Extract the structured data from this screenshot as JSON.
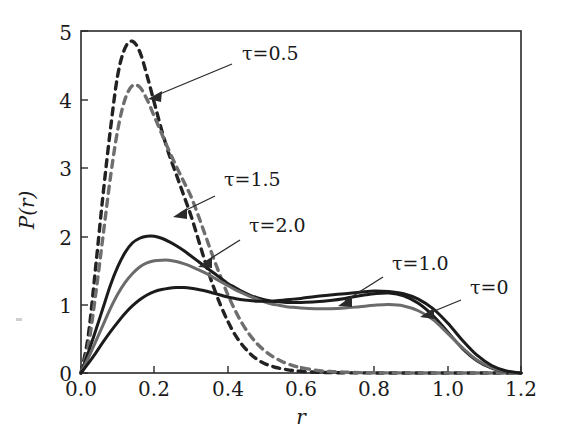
{
  "figure": {
    "background_color": "#ffffff",
    "frame_color": "#2a2a2a"
  },
  "axes": {
    "x_title": "r",
    "y_title": "P(r)",
    "x_ticks": [
      "0.0",
      "0.2",
      "0.4",
      "0.6",
      "0.8",
      "1.0",
      "1.2"
    ],
    "y_ticks": [
      "0",
      "1",
      "2",
      "3",
      "4",
      "5"
    ]
  },
  "annotations": [
    {
      "name": "tau-0.5",
      "text": "τ=0.5"
    },
    {
      "name": "tau-1.5",
      "text": "τ=1.5"
    },
    {
      "name": "tau-2.0",
      "text": "τ=2.0"
    },
    {
      "name": "tau-1.0",
      "text": "τ=1.0"
    },
    {
      "name": "tau-0",
      "text": "τ=0"
    }
  ],
  "chart_data": {
    "type": "line",
    "title": "",
    "xlabel": "r",
    "ylabel": "P(r)",
    "xlim": [
      0.0,
      1.2
    ],
    "ylim": [
      0,
      5
    ],
    "xticks": [
      0.0,
      0.2,
      0.4,
      0.6,
      0.8,
      1.0,
      1.2
    ],
    "yticks": [
      0,
      1,
      2,
      3,
      4,
      5
    ],
    "grid": false,
    "legend": "inline-annotations",
    "x": [
      0.0,
      0.02,
      0.04,
      0.06,
      0.08,
      0.1,
      0.12,
      0.14,
      0.16,
      0.18,
      0.2,
      0.22,
      0.24,
      0.26,
      0.28,
      0.3,
      0.32,
      0.34,
      0.36,
      0.38,
      0.4,
      0.42,
      0.44,
      0.46,
      0.48,
      0.5,
      0.52,
      0.54,
      0.56,
      0.58,
      0.6,
      0.64,
      0.68,
      0.72,
      0.76,
      0.8,
      0.84,
      0.88,
      0.92,
      0.96,
      1.0,
      1.04,
      1.08,
      1.12,
      1.16,
      1.2
    ],
    "series": [
      {
        "name": "τ=0.5",
        "style": "dashed",
        "color": "#222222",
        "peak_x": 0.13,
        "peak_y": 4.85,
        "values": [
          0.0,
          0.55,
          1.55,
          2.6,
          3.55,
          4.35,
          4.75,
          4.85,
          4.7,
          4.35,
          3.95,
          3.55,
          3.2,
          2.9,
          2.6,
          2.3,
          1.95,
          1.6,
          1.28,
          1.0,
          0.76,
          0.56,
          0.41,
          0.29,
          0.2,
          0.14,
          0.1,
          0.07,
          0.05,
          0.035,
          0.025,
          0.012,
          0.006,
          0.003,
          0.002,
          0.001,
          0.0,
          0.0,
          0.0,
          0.0,
          0.0,
          0.0,
          0.0,
          0.0,
          0.0,
          0.0
        ]
      },
      {
        "name": "τ=1.5",
        "style": "dashed",
        "color": "#6e6e6e",
        "peak_x": 0.145,
        "peak_y": 4.2,
        "values": [
          0.0,
          0.4,
          1.15,
          2.0,
          2.85,
          3.55,
          4.0,
          4.2,
          4.18,
          4.0,
          3.75,
          3.5,
          3.25,
          3.02,
          2.8,
          2.58,
          2.3,
          2.0,
          1.7,
          1.42,
          1.15,
          0.92,
          0.72,
          0.56,
          0.43,
          0.33,
          0.25,
          0.19,
          0.14,
          0.105,
          0.078,
          0.042,
          0.022,
          0.012,
          0.006,
          0.003,
          0.002,
          0.001,
          0.0,
          0.0,
          0.0,
          0.0,
          0.0,
          0.0,
          0.0,
          0.0
        ]
      },
      {
        "name": "τ=2.0",
        "style": "solid",
        "color": "#1b1b1b",
        "peak_x": 0.2,
        "peak_y": 2.0,
        "values": [
          0.0,
          0.3,
          0.62,
          0.95,
          1.28,
          1.55,
          1.76,
          1.9,
          1.97,
          2.0,
          2.0,
          1.97,
          1.92,
          1.86,
          1.79,
          1.71,
          1.63,
          1.55,
          1.47,
          1.39,
          1.31,
          1.25,
          1.19,
          1.14,
          1.1,
          1.07,
          1.05,
          1.04,
          1.03,
          1.03,
          1.03,
          1.04,
          1.06,
          1.09,
          1.13,
          1.16,
          1.17,
          1.13,
          1.02,
          0.84,
          0.6,
          0.36,
          0.18,
          0.07,
          0.02,
          0.0
        ]
      },
      {
        "name": "τ=1.0",
        "style": "solid",
        "color": "#6b6b6b",
        "peak_x": 0.23,
        "peak_y": 1.65,
        "values": [
          0.0,
          0.22,
          0.46,
          0.7,
          0.94,
          1.15,
          1.32,
          1.45,
          1.55,
          1.61,
          1.64,
          1.65,
          1.65,
          1.63,
          1.6,
          1.56,
          1.51,
          1.46,
          1.4,
          1.34,
          1.28,
          1.22,
          1.17,
          1.12,
          1.08,
          1.04,
          1.01,
          0.99,
          0.97,
          0.96,
          0.95,
          0.94,
          0.94,
          0.95,
          0.97,
          0.99,
          1.0,
          0.98,
          0.91,
          0.78,
          0.58,
          0.37,
          0.19,
          0.08,
          0.02,
          0.0
        ]
      },
      {
        "name": "τ=0",
        "style": "solid",
        "color": "#1b1b1b",
        "peak_x": 0.27,
        "peak_y": 1.25,
        "second_peak_x": 0.8,
        "second_peak_y": 1.2,
        "values": [
          0.0,
          0.14,
          0.29,
          0.45,
          0.6,
          0.74,
          0.87,
          0.98,
          1.07,
          1.14,
          1.19,
          1.22,
          1.24,
          1.25,
          1.25,
          1.24,
          1.22,
          1.2,
          1.17,
          1.14,
          1.11,
          1.09,
          1.07,
          1.06,
          1.05,
          1.05,
          1.05,
          1.06,
          1.07,
          1.08,
          1.09,
          1.12,
          1.14,
          1.16,
          1.18,
          1.2,
          1.19,
          1.16,
          1.08,
          0.94,
          0.73,
          0.48,
          0.26,
          0.11,
          0.03,
          0.0
        ]
      }
    ]
  }
}
